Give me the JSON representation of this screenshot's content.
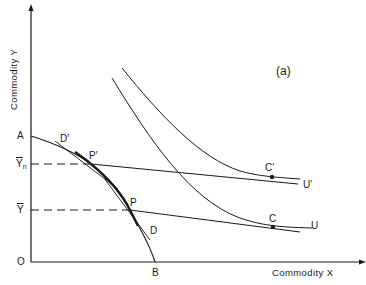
{
  "diagram": {
    "panel_label": "(a)",
    "axes": {
      "y_title": "Commodity Y",
      "x_title": "Commodity X",
      "origin_label": "O"
    },
    "points": {
      "A": "A",
      "B": "B",
      "P": "P",
      "P_prime": "P′",
      "C": "C",
      "C_prime": "C′"
    },
    "curve_labels": {
      "D": "D",
      "D_prime": "D′",
      "U": "U",
      "U_prime": "U′"
    },
    "y_levels": {
      "Y_n": "Y",
      "Y_n_sub": "n",
      "Y_bar": "Y"
    },
    "colors": {
      "ink": "#1a1a1a",
      "background": "#ffffff"
    }
  }
}
